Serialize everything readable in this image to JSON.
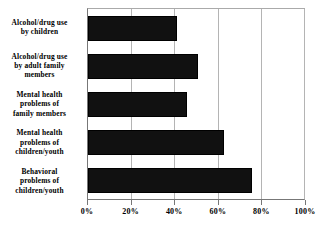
{
  "chart_data": {
    "type": "bar",
    "orientation": "horizontal",
    "title": "",
    "subtitle": "",
    "xlabel": "",
    "ylabel": "",
    "categories": [
      "Alcohol/drug use by children",
      "Alcohol/drug use by adult family members",
      "Mental health problems of family members",
      "Mental health problems of children/youth",
      "Behavioral problems of children/youth"
    ],
    "category_lines": [
      [
        "Alcohol/drug use",
        "by children"
      ],
      [
        "Alcohol/drug use",
        "by adult family",
        "members"
      ],
      [
        "Mental health",
        "problems of",
        "family members"
      ],
      [
        "Mental health",
        "problems of",
        "children/youth"
      ],
      [
        "Behavioral",
        "problems of",
        "children/youth"
      ]
    ],
    "values": [
      41,
      51,
      46,
      63,
      76
    ],
    "xlim": [
      0,
      100
    ],
    "xticks": [
      0,
      20,
      40,
      60,
      80,
      100
    ],
    "xticklabels": [
      "0%",
      "20%",
      "40%",
      "60%",
      "80%",
      "100%"
    ],
    "grid": true,
    "grid_axis": "x",
    "legend": false,
    "bar_color": "#111111",
    "grid_color": "#b4b4b4",
    "axis_color": "#777777",
    "background_color": "#ffffff"
  }
}
